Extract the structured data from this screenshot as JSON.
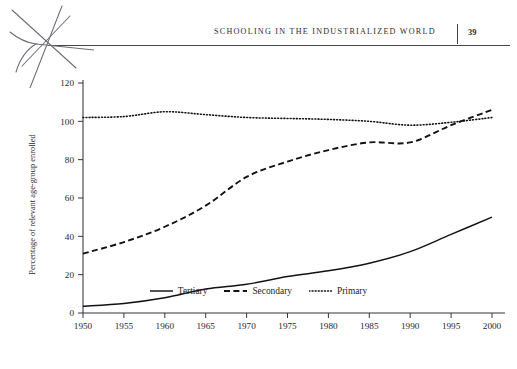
{
  "header": {
    "title": "Schooling in the Industrialized World",
    "page_number": "39",
    "divider_icon": "vertical-rule"
  },
  "artifact": {
    "name": "scan-star-mark"
  },
  "chart_data": {
    "type": "line",
    "title": "",
    "xlabel": "",
    "ylabel": "Percentage of relevant age-group enrolled",
    "xlim": [
      1950,
      2000
    ],
    "ylim": [
      0,
      120
    ],
    "grid": false,
    "legend_position": "bottom-center",
    "x": [
      1950,
      1955,
      1960,
      1965,
      1970,
      1975,
      1980,
      1985,
      1990,
      1995,
      2000
    ],
    "xticks": [
      "1950",
      "1955",
      "1960",
      "1965",
      "1970",
      "1975",
      "1980",
      "1985",
      "1990",
      "1995",
      "2000"
    ],
    "yticks": [
      "0",
      "20",
      "40",
      "60",
      "80",
      "100",
      "120"
    ],
    "series": [
      {
        "name": "Tertiary",
        "style": "solid",
        "values": [
          3.5,
          5,
          8,
          12.5,
          15,
          19,
          22,
          26,
          32,
          41,
          50
        ]
      },
      {
        "name": "Secondary",
        "style": "dashed",
        "values": [
          31,
          37,
          45,
          56,
          71,
          79,
          85,
          89,
          89,
          98,
          106
        ]
      },
      {
        "name": "Primary",
        "style": "dotted",
        "values": [
          102,
          102.5,
          105,
          103.5,
          102,
          101.5,
          101,
          100,
          98,
          99.5,
          102
        ]
      }
    ]
  },
  "legend": {
    "items": [
      {
        "label": "Tertiary",
        "style": "solid"
      },
      {
        "label": "Secondary",
        "style": "dashed"
      },
      {
        "label": "Primary",
        "style": "dotted"
      }
    ]
  }
}
